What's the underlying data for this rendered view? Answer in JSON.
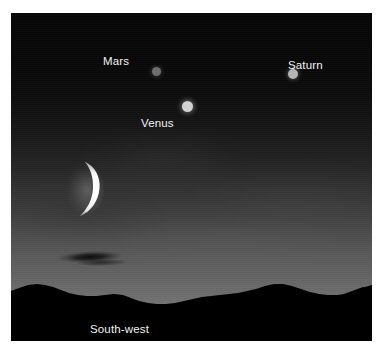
{
  "scene": {
    "kind": "twilight-sky-photograph",
    "caption_direction": "South-west",
    "frame": {
      "border_color": "#ffffff",
      "plate_left": 11,
      "plate_top": 13,
      "plate_width": 361,
      "plate_height": 328
    },
    "sky": {
      "gradient_top_color": "#060606",
      "gradient_horizon_color": "#727272",
      "description": "deep twilight gradient darkening toward the zenith"
    },
    "objects": [
      {
        "id": "mars",
        "label": "Mars",
        "type": "planet",
        "dot_color": "#6e6e6e",
        "dot_diameter_px": 9,
        "dot_x": 146,
        "dot_y": 72,
        "label_x": 103,
        "label_y": 56,
        "label_position": "left-of-dot",
        "brightness": "dim"
      },
      {
        "id": "venus",
        "label": "Venus",
        "type": "planet",
        "dot_color": "#d2d2d2",
        "dot_diameter_px": 11,
        "dot_x": 178,
        "dot_y": 107,
        "label_x": 141,
        "label_y": 118,
        "label_position": "below-left-of-dot",
        "brightness": "brightest"
      },
      {
        "id": "saturn",
        "label": "Saturn",
        "type": "planet",
        "dot_color": "#b4b4b4",
        "dot_diameter_px": 10,
        "dot_x": 283,
        "dot_y": 74,
        "label_x": 289,
        "label_y": 60,
        "label_position": "right-of-dot",
        "brightness": "medium"
      },
      {
        "id": "moon",
        "label": "",
        "type": "crescent-moon",
        "limb_color": "#ffffff",
        "center_x": 75,
        "center_y": 180,
        "phase": "thin crescent, illuminated limb facing right",
        "brightness": "brightest"
      }
    ],
    "cloud_streak": {
      "x": 60,
      "y": 256,
      "width_px": 66,
      "color": "#000000",
      "description": "dark elongated cloud bar low in the sky"
    },
    "horizon": {
      "silhouette_color": "#000000",
      "description": "black mountain ridgeline across the base of the frame",
      "ridge_top_y": 293
    }
  }
}
